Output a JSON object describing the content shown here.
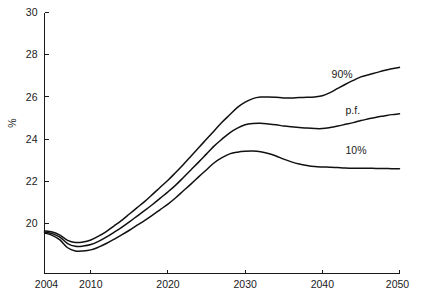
{
  "chart_data": {
    "type": "line",
    "title": "",
    "subtitle": "",
    "xlabel": "",
    "ylabel": "%",
    "xlim": [
      2004,
      2050
    ],
    "ylim": [
      17.63,
      30
    ],
    "grid": false,
    "legend_position": "inline-right",
    "x_ticks": [
      2004,
      2010,
      2020,
      2030,
      2040,
      2050
    ],
    "x_tick_labels": [
      "2004",
      "2010",
      "2020",
      "2030",
      "2040",
      "2050"
    ],
    "y_ticks": [
      20,
      22,
      24,
      26,
      28,
      30
    ],
    "y_tick_labels": [
      "20",
      "22",
      "24",
      "26",
      "28",
      "30"
    ],
    "x": [
      2004,
      2005,
      2006,
      2007,
      2008,
      2009,
      2010,
      2011,
      2012,
      2013,
      2014,
      2015,
      2016,
      2017,
      2018,
      2019,
      2020,
      2021,
      2022,
      2023,
      2024,
      2025,
      2026,
      2027,
      2028,
      2029,
      2030,
      2031,
      2032,
      2033,
      2034,
      2035,
      2036,
      2037,
      2038,
      2039,
      2040,
      2041,
      2042,
      2043,
      2044,
      2045,
      2046,
      2047,
      2048,
      2049,
      2050
    ],
    "series": [
      {
        "name": "90%",
        "label": "90%",
        "color": "#111111",
        "values": [
          19.65,
          19.6,
          19.45,
          19.2,
          19.1,
          19.12,
          19.22,
          19.4,
          19.62,
          19.88,
          20.15,
          20.45,
          20.75,
          21.05,
          21.38,
          21.72,
          22.05,
          22.42,
          22.8,
          23.2,
          23.6,
          24.0,
          24.4,
          24.8,
          25.15,
          25.5,
          25.75,
          25.92,
          25.99,
          26.0,
          25.98,
          25.95,
          25.95,
          25.97,
          25.98,
          26.0,
          26.05,
          26.2,
          26.4,
          26.6,
          26.78,
          26.95,
          27.05,
          27.15,
          27.25,
          27.33,
          27.4
        ]
      },
      {
        "name": "p.f.",
        "label": "p.f.",
        "color": "#111111",
        "values": [
          19.6,
          19.52,
          19.35,
          19.05,
          18.92,
          18.93,
          19.0,
          19.15,
          19.35,
          19.58,
          19.82,
          20.08,
          20.35,
          20.62,
          20.9,
          21.2,
          21.5,
          21.82,
          22.18,
          22.55,
          22.92,
          23.3,
          23.68,
          24.0,
          24.3,
          24.52,
          24.68,
          24.74,
          24.75,
          24.72,
          24.68,
          24.62,
          24.58,
          24.55,
          24.52,
          24.5,
          24.5,
          24.55,
          24.62,
          24.7,
          24.78,
          24.88,
          24.96,
          25.04,
          25.1,
          25.16,
          25.2
        ]
      },
      {
        "name": "10%",
        "label": "10%",
        "color": "#111111",
        "values": [
          19.55,
          19.44,
          19.22,
          18.85,
          18.7,
          18.7,
          18.75,
          18.88,
          19.05,
          19.25,
          19.46,
          19.68,
          19.92,
          20.15,
          20.4,
          20.66,
          20.92,
          21.22,
          21.55,
          21.88,
          22.22,
          22.55,
          22.88,
          23.12,
          23.3,
          23.38,
          23.42,
          23.43,
          23.4,
          23.32,
          23.2,
          23.05,
          22.92,
          22.82,
          22.75,
          22.7,
          22.68,
          22.67,
          22.65,
          22.63,
          22.62,
          22.62,
          22.62,
          22.61,
          22.61,
          22.6,
          22.6
        ]
      }
    ],
    "annotations": [
      {
        "text": "90%",
        "x": 2041.2,
        "y": 26.9,
        "for_series": "90%"
      },
      {
        "text": "p.f.",
        "x": 2043.0,
        "y": 25.2,
        "for_series": "p.f."
      },
      {
        "text": "10%",
        "x": 2043.0,
        "y": 23.3,
        "for_series": "10%"
      }
    ]
  }
}
